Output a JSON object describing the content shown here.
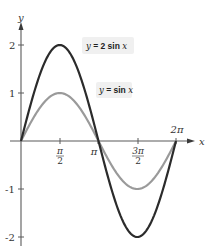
{
  "chart_data": {
    "type": "line",
    "title": "",
    "xlabel": "x",
    "ylabel": "y",
    "xlim": [
      0,
      6.2832
    ],
    "ylim": [
      -2,
      2
    ],
    "grid": false,
    "x_ticks": [
      {
        "value": 1.5708,
        "label_num": "π",
        "label_den": "2"
      },
      {
        "value": 3.1416,
        "label": "π"
      },
      {
        "value": 4.7124,
        "label_num": "3π",
        "label_den": "2"
      },
      {
        "value": 6.2832,
        "label": "2π"
      }
    ],
    "y_ticks": [
      {
        "value": 2,
        "label": "2"
      },
      {
        "value": 1,
        "label": "1"
      },
      {
        "value": -1,
        "label": "-1"
      },
      {
        "value": -2,
        "label": "-2"
      }
    ],
    "series": [
      {
        "name": "y = 2 sin x",
        "amplitude": 2,
        "color": "#2b2b2b",
        "x": [
          0,
          1.5708,
          3.1416,
          4.7124,
          6.2832
        ],
        "values": [
          0,
          2,
          0,
          -2,
          0
        ]
      },
      {
        "name": "y = sin x",
        "amplitude": 1,
        "color": "#9a9a9a",
        "x": [
          0,
          1.5708,
          3.1416,
          4.7124,
          6.2832
        ],
        "values": [
          0,
          1,
          0,
          -1,
          0
        ]
      }
    ],
    "annotations": [
      {
        "text": "y = 2 sin x",
        "prefix": "y",
        "eq": " = ",
        "coef": "2 ",
        "fn": "sin ",
        "var": "x",
        "target_series": 0
      },
      {
        "text": "y = sin x",
        "prefix": "y",
        "eq": " = ",
        "coef": "",
        "fn": "sin ",
        "var": "x",
        "target_series": 1
      }
    ],
    "legend_position": "inline-labels"
  },
  "axes": {
    "x_label": "x",
    "y_label": "y"
  }
}
